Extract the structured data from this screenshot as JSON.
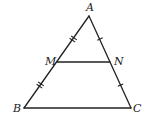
{
  "diagram": {
    "type": "triangle-midsegment",
    "vertices": {
      "A": {
        "label": "A",
        "x": 89,
        "y": 16
      },
      "B": {
        "label": "B",
        "x": 24,
        "y": 108
      },
      "C": {
        "label": "C",
        "x": 131,
        "y": 108
      },
      "M": {
        "label": "M",
        "x": 57,
        "y": 62
      },
      "N": {
        "label": "N",
        "x": 110,
        "y": 62
      }
    },
    "segments": [
      "AB",
      "AC",
      "BC",
      "MN"
    ],
    "tick_marks": [
      {
        "segment": "AM",
        "count": 2
      },
      {
        "segment": "MB",
        "count": 2
      },
      {
        "segment": "AN",
        "count": 1
      },
      {
        "segment": "NC",
        "count": 1
      }
    ],
    "stroke_color": "#222222"
  }
}
